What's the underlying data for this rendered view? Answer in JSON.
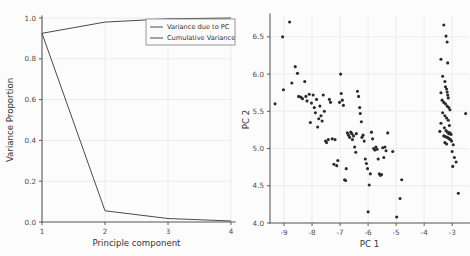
{
  "figure": {
    "background": "#fcfcfc",
    "ink_color": "#4a4a4a",
    "marker_color": "#2b2b2b",
    "grid_color": "#e9e9e9"
  },
  "chart_data": [
    {
      "id": "scree-plot",
      "type": "line",
      "title": "",
      "xlabel": "Principle component",
      "ylabel": "Variance Proportion",
      "x": [
        1,
        2,
        3,
        4
      ],
      "xlim": [
        1,
        4
      ],
      "ylim": [
        0.0,
        1.0
      ],
      "xticks": [
        1,
        2,
        3,
        4
      ],
      "xticklabels": [
        "1",
        "2",
        "3",
        "4"
      ],
      "yticks": [
        0.0,
        0.2,
        0.4,
        0.6,
        0.8,
        1.0
      ],
      "yticklabels": [
        "0.0",
        "0.2",
        "0.4",
        "0.6",
        "0.8",
        "1.0"
      ],
      "grid": true,
      "legend_position": "upper right",
      "series": [
        {
          "name": "Variance due to PC",
          "values": [
            0.925,
            0.055,
            0.017,
            0.005
          ]
        },
        {
          "name": "Cumulative Variance",
          "values": [
            0.925,
            0.98,
            0.996,
            1.0
          ]
        }
      ]
    },
    {
      "id": "pc-scatter",
      "type": "scatter",
      "title": "",
      "xlabel": "PC 1",
      "ylabel": "PC 2",
      "xlim": [
        -9.5,
        -2.4
      ],
      "ylim": [
        4.0,
        6.78
      ],
      "xticks": [
        -9,
        -8,
        -7,
        -6,
        -5,
        -4,
        -3
      ],
      "xticklabels": [
        "-9",
        "-8",
        "-7",
        "-6",
        "-5",
        "-4",
        "-3"
      ],
      "yticks": [
        4.0,
        4.5,
        5.0,
        5.5,
        6.0,
        6.5
      ],
      "yticklabels": [
        "4.0",
        "4.5",
        "5.0",
        "5.5",
        "6.0",
        "6.5"
      ],
      "grid": true,
      "legend_position": "none",
      "points": [
        [
          -9.32,
          5.6
        ],
        [
          -9.05,
          6.5
        ],
        [
          -9.02,
          5.79
        ],
        [
          -8.8,
          6.7
        ],
        [
          -8.72,
          5.88
        ],
        [
          -8.6,
          6.1
        ],
        [
          -8.52,
          6.01
        ],
        [
          -8.48,
          5.7
        ],
        [
          -8.4,
          5.69
        ],
        [
          -8.34,
          5.67
        ],
        [
          -8.26,
          5.9
        ],
        [
          -8.22,
          5.7
        ],
        [
          -8.18,
          5.64
        ],
        [
          -8.1,
          5.73
        ],
        [
          -8.06,
          5.35
        ],
        [
          -8.02,
          5.61
        ],
        [
          -7.96,
          5.72
        ],
        [
          -7.92,
          5.55
        ],
        [
          -7.88,
          5.48
        ],
        [
          -7.84,
          5.66
        ],
        [
          -7.8,
          5.29
        ],
        [
          -7.76,
          5.4
        ],
        [
          -7.72,
          5.57
        ],
        [
          -7.68,
          5.44
        ],
        [
          -7.64,
          5.37
        ],
        [
          -7.6,
          5.72
        ],
        [
          -7.56,
          5.5
        ],
        [
          -7.52,
          5.1
        ],
        [
          -7.48,
          5.08
        ],
        [
          -7.42,
          5.12
        ],
        [
          -7.38,
          5.66
        ],
        [
          -7.34,
          5.62
        ],
        [
          -7.28,
          5.13
        ],
        [
          -7.22,
          4.79
        ],
        [
          -7.18,
          5.12
        ],
        [
          -7.12,
          4.77
        ],
        [
          -7.08,
          4.84
        ],
        [
          -7.02,
          5.62
        ],
        [
          -6.98,
          6.0
        ],
        [
          -6.96,
          5.74
        ],
        [
          -6.92,
          5.65
        ],
        [
          -6.88,
          5.58
        ],
        [
          -6.84,
          4.58
        ],
        [
          -6.8,
          4.57
        ],
        [
          -6.78,
          4.73
        ],
        [
          -6.74,
          5.21
        ],
        [
          -6.7,
          5.18
        ],
        [
          -6.66,
          5.15
        ],
        [
          -6.62,
          5.22
        ],
        [
          -6.58,
          5.2
        ],
        [
          -6.56,
          5.12
        ],
        [
          -6.52,
          5.17
        ],
        [
          -6.48,
          5.02
        ],
        [
          -6.44,
          4.95
        ],
        [
          -6.42,
          5.2
        ],
        [
          -6.38,
          5.77
        ],
        [
          -6.34,
          5.7
        ],
        [
          -6.3,
          5.55
        ],
        [
          -6.28,
          5.47
        ],
        [
          -6.24,
          5.36
        ],
        [
          -6.22,
          5.15
        ],
        [
          -6.18,
          5.18
        ],
        [
          -6.14,
          5.1
        ],
        [
          -6.1,
          4.86
        ],
        [
          -6.06,
          4.8
        ],
        [
          -6.02,
          4.73
        ],
        [
          -6.0,
          4.15
        ],
        [
          -5.96,
          4.51
        ],
        [
          -5.92,
          4.66
        ],
        [
          -5.88,
          5.22
        ],
        [
          -5.84,
          5.13
        ],
        [
          -5.8,
          5.0
        ],
        [
          -5.76,
          4.98
        ],
        [
          -5.72,
          5.02
        ],
        [
          -5.68,
          4.99
        ],
        [
          -5.64,
          4.86
        ],
        [
          -5.6,
          4.66
        ],
        [
          -5.56,
          4.64
        ],
        [
          -5.52,
          4.65
        ],
        [
          -5.48,
          5.01
        ],
        [
          -5.44,
          4.88
        ],
        [
          -5.4,
          5.02
        ],
        [
          -5.36,
          4.97
        ],
        [
          -5.3,
          5.21
        ],
        [
          -5.12,
          4.96
        ],
        [
          -4.98,
          4.08
        ],
        [
          -4.86,
          4.33
        ],
        [
          -4.8,
          4.58
        ],
        [
          -3.3,
          6.66
        ],
        [
          -3.22,
          6.51
        ],
        [
          -3.18,
          6.43
        ],
        [
          -3.4,
          6.2
        ],
        [
          -3.16,
          6.15
        ],
        [
          -3.34,
          5.97
        ],
        [
          -3.26,
          5.9
        ],
        [
          -3.24,
          5.83
        ],
        [
          -3.2,
          5.8
        ],
        [
          -3.18,
          5.76
        ],
        [
          -3.4,
          5.75
        ],
        [
          -3.16,
          5.72
        ],
        [
          -3.14,
          5.68
        ],
        [
          -3.36,
          5.65
        ],
        [
          -3.3,
          5.62
        ],
        [
          -3.24,
          5.6
        ],
        [
          -3.18,
          5.57
        ],
        [
          -3.12,
          5.55
        ],
        [
          -3.08,
          5.52
        ],
        [
          -3.34,
          5.48
        ],
        [
          -2.52,
          5.47
        ],
        [
          -3.26,
          5.44
        ],
        [
          -3.2,
          5.41
        ],
        [
          -3.14,
          5.38
        ],
        [
          -3.4,
          5.34
        ],
        [
          -3.1,
          5.31
        ],
        [
          -3.28,
          5.28
        ],
        [
          -3.22,
          5.24
        ],
        [
          -3.16,
          5.22
        ],
        [
          -3.12,
          5.2
        ],
        [
          -3.08,
          5.21
        ],
        [
          -3.04,
          5.19
        ],
        [
          -3.3,
          5.17
        ],
        [
          -3.24,
          5.16
        ],
        [
          -3.18,
          5.15
        ],
        [
          -3.14,
          5.14
        ],
        [
          -3.1,
          5.13
        ],
        [
          -3.06,
          5.12
        ],
        [
          -3.02,
          5.1
        ],
        [
          -3.26,
          5.08
        ],
        [
          -3.2,
          5.06
        ],
        [
          -2.96,
          5.05
        ],
        [
          -3.44,
          5.23
        ],
        [
          -3.0,
          4.96
        ],
        [
          -2.92,
          4.88
        ],
        [
          -2.86,
          4.82
        ],
        [
          -2.98,
          4.76
        ],
        [
          -2.78,
          4.4
        ]
      ]
    }
  ]
}
